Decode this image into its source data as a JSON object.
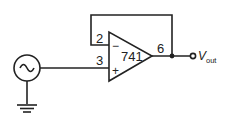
{
  "diagram": {
    "type": "circuit-schematic",
    "opamp": {
      "label": "741",
      "inverting_symbol": "−",
      "noninverting_symbol": "+",
      "pins": {
        "inverting": "2",
        "noninverting": "3",
        "output": "6"
      }
    },
    "source": {
      "type": "ac-voltage-source",
      "glyph": "~"
    },
    "output": {
      "label_main": "V",
      "label_sub": "out"
    },
    "colors": {
      "stroke": "#222222",
      "background": "#ffffff"
    }
  }
}
